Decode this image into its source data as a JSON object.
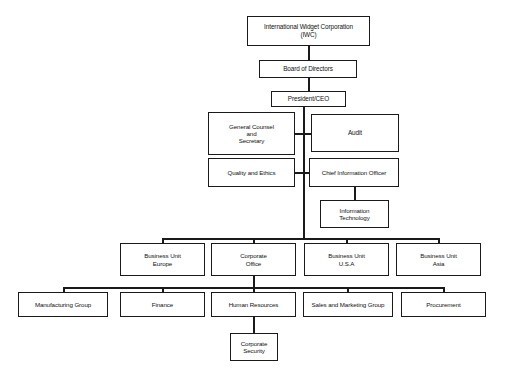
{
  "chart_title": "International Widget Corporation Organizational Chart",
  "style": {
    "background": "#ffffff",
    "box_border": "#1a1a1a",
    "box_fill": "#ffffff",
    "line_color": "#1a1a1a",
    "text_color": "#111111"
  },
  "nodes": {
    "corporation": {
      "label": "International Widget Corporation\n(IWC)",
      "x": 247,
      "y": 16,
      "w": 123,
      "h": 30,
      "font": 6.4
    },
    "board": {
      "label": "Board of Directors",
      "x": 259,
      "y": 60,
      "w": 98,
      "h": 18,
      "font": 6.4
    },
    "president": {
      "label": "President/CEO",
      "x": 271,
      "y": 91,
      "w": 75,
      "h": 16,
      "font": 6.4
    },
    "general_counsel": {
      "label": "General Counsel\nand\nSecretary",
      "x": 208,
      "y": 112,
      "w": 87,
      "h": 43,
      "font": 6.2
    },
    "audit": {
      "label": "Audit",
      "x": 311,
      "y": 114,
      "w": 88,
      "h": 38,
      "font": 6.4
    },
    "quality_ethics": {
      "label": "Quality and Ethics",
      "x": 208,
      "y": 158,
      "w": 87,
      "h": 29,
      "font": 6.2
    },
    "cio": {
      "label": "Chief Information Officer",
      "x": 309,
      "y": 158,
      "w": 90,
      "h": 29,
      "font": 6.2
    },
    "information_technology": {
      "label": "Information\nTechnology",
      "x": 320,
      "y": 200,
      "w": 69,
      "h": 28,
      "font": 6.2
    },
    "bu_europe": {
      "label": "Business Unit\nEurope",
      "x": 120,
      "y": 243,
      "w": 85,
      "h": 33,
      "font": 6.2
    },
    "corporate_office": {
      "label": "Corporate\nOffice",
      "x": 211,
      "y": 243,
      "w": 85,
      "h": 33,
      "font": 6.2
    },
    "bu_usa": {
      "label": "Business Unit\nU.S.A",
      "x": 304,
      "y": 243,
      "w": 85,
      "h": 33,
      "font": 6.2
    },
    "bu_asia": {
      "label": "Business Unit\nAsia",
      "x": 396,
      "y": 243,
      "w": 85,
      "h": 33,
      "font": 6.2
    },
    "manufacturing_group": {
      "label": "Manufacturing Group",
      "x": 18,
      "y": 292,
      "w": 90,
      "h": 25,
      "font": 6.2
    },
    "finance": {
      "label": "Finance",
      "x": 120,
      "y": 292,
      "w": 85,
      "h": 25,
      "font": 6.2
    },
    "human_resources": {
      "label": "Human Resources",
      "x": 211,
      "y": 292,
      "w": 85,
      "h": 25,
      "font": 6.2
    },
    "sales_marketing_group": {
      "label": "Sales and Marketing Group",
      "x": 303,
      "y": 292,
      "w": 90,
      "h": 25,
      "font": 6.2
    },
    "procurement": {
      "label": "Procurement",
      "x": 401,
      "y": 292,
      "w": 85,
      "h": 25,
      "font": 6.2
    },
    "corporate_security": {
      "label": "Corporate\nSecurity",
      "x": 230,
      "y": 333,
      "w": 48,
      "h": 28,
      "font": 6.2
    }
  },
  "connectors": [
    {
      "name": "corporation-to-board",
      "o": "v",
      "x": 308,
      "y": 46,
      "len": 14
    },
    {
      "name": "board-to-president",
      "o": "v",
      "x": 308,
      "y": 78,
      "len": 13
    },
    {
      "name": "president-spine",
      "o": "v",
      "x": 303,
      "y": 107,
      "len": 131
    },
    {
      "name": "spine-to-general-counsel",
      "o": "h",
      "x": 295,
      "y": 133,
      "len": 8
    },
    {
      "name": "spine-to-audit",
      "o": "h",
      "x": 303,
      "y": 133,
      "len": 8
    },
    {
      "name": "spine-to-quality-ethics",
      "o": "h",
      "x": 295,
      "y": 172,
      "len": 8
    },
    {
      "name": "spine-to-cio",
      "o": "h",
      "x": 303,
      "y": 172,
      "len": 6
    },
    {
      "name": "cio-to-it",
      "o": "v",
      "x": 354,
      "y": 187,
      "len": 13
    },
    {
      "name": "business-unit-bus",
      "o": "h",
      "x": 162,
      "y": 238,
      "len": 277
    },
    {
      "name": "bus-drop-europe",
      "o": "v",
      "x": 162,
      "y": 238,
      "len": 5
    },
    {
      "name": "bus-drop-corporate-office",
      "o": "v",
      "x": 253,
      "y": 238,
      "len": 5
    },
    {
      "name": "bus-drop-usa",
      "o": "v",
      "x": 346,
      "y": 238,
      "len": 5
    },
    {
      "name": "bus-drop-asia",
      "o": "v",
      "x": 438,
      "y": 238,
      "len": 5
    },
    {
      "name": "corporate-office-drop",
      "o": "v",
      "x": 253,
      "y": 276,
      "len": 11
    },
    {
      "name": "functional-bus",
      "o": "h",
      "x": 63,
      "y": 287,
      "len": 381
    },
    {
      "name": "functional-drop-manufacturing",
      "o": "v",
      "x": 63,
      "y": 287,
      "len": 5
    },
    {
      "name": "functional-drop-finance",
      "o": "v",
      "x": 162,
      "y": 287,
      "len": 5
    },
    {
      "name": "functional-drop-hr",
      "o": "v",
      "x": 253,
      "y": 287,
      "len": 5
    },
    {
      "name": "functional-drop-sales",
      "o": "v",
      "x": 347,
      "y": 287,
      "len": 5
    },
    {
      "name": "functional-drop-procurement",
      "o": "v",
      "x": 443,
      "y": 287,
      "len": 5
    },
    {
      "name": "hr-to-corporate-security",
      "o": "v",
      "x": 253,
      "y": 317,
      "len": 16
    }
  ]
}
